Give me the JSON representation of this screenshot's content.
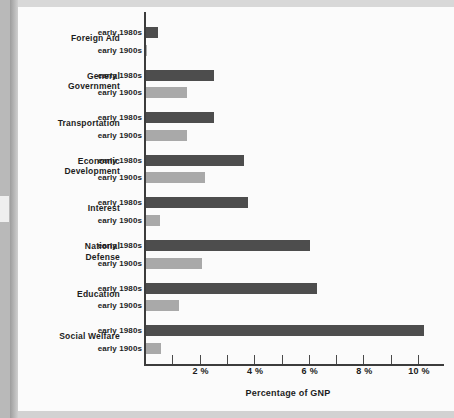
{
  "chart_data": {
    "type": "bar",
    "orientation": "horizontal",
    "title": "",
    "xlabel": "Percentage of GNP",
    "ylabel": "",
    "xlim": [
      0,
      11
    ],
    "xticks": [
      1,
      2,
      3,
      4,
      5,
      6,
      7,
      8,
      9,
      10
    ],
    "xticklabels": [
      "",
      "2 %",
      "",
      "4 %",
      "",
      "6 %",
      "",
      "8 %",
      "",
      "10 %"
    ],
    "grid": false,
    "legend_position": "inline-row-labels",
    "categories": [
      "Foreign Aid",
      "General Government",
      "Transportation",
      "Economic Development",
      "Interest",
      "National Defense",
      "Education",
      "Social Welfare"
    ],
    "series": [
      {
        "name": "early 1980s",
        "color": "#4d4d4d",
        "values": [
          0.45,
          2.5,
          2.5,
          3.6,
          3.75,
          6.0,
          6.25,
          10.2
        ]
      },
      {
        "name": "early 1900s",
        "color": "#a9a9a9",
        "values": [
          0.03,
          1.5,
          1.5,
          2.15,
          0.5,
          2.05,
          1.2,
          0.55
        ]
      }
    ]
  },
  "axis": {
    "title": "Percentage of GNP",
    "ticks": [
      {
        "value": 1,
        "label": ""
      },
      {
        "value": 2,
        "label": "2 %"
      },
      {
        "value": 3,
        "label": ""
      },
      {
        "value": 4,
        "label": "4 %"
      },
      {
        "value": 5,
        "label": ""
      },
      {
        "value": 6,
        "label": "6 %"
      },
      {
        "value": 7,
        "label": ""
      },
      {
        "value": 8,
        "label": "8 %"
      },
      {
        "value": 9,
        "label": ""
      },
      {
        "value": 10,
        "label": "10 %"
      }
    ]
  },
  "groups": [
    {
      "name": "Foreign Aid",
      "line1": "Foreign  Aid",
      "line2": "",
      "rows": [
        {
          "label": "early 1980s",
          "value": 0.45,
          "series": 0
        },
        {
          "label": "early 1900s",
          "value": 0.03,
          "series": 1
        }
      ]
    },
    {
      "name": "General Government",
      "line1": "General",
      "line2": "Government",
      "rows": [
        {
          "label": "early 1980s",
          "value": 2.5,
          "series": 0
        },
        {
          "label": "early 1900s",
          "value": 1.5,
          "series": 1
        }
      ]
    },
    {
      "name": "Transportation",
      "line1": "Transportation",
      "line2": "",
      "rows": [
        {
          "label": "early 1980s",
          "value": 2.5,
          "series": 0
        },
        {
          "label": "early 1900s",
          "value": 1.5,
          "series": 1
        }
      ]
    },
    {
      "name": "Economic Development",
      "line1": "Economic",
      "line2": "Development",
      "rows": [
        {
          "label": "early 1980s",
          "value": 3.6,
          "series": 0
        },
        {
          "label": "early 1900s",
          "value": 2.15,
          "series": 1
        }
      ]
    },
    {
      "name": "Interest",
      "line1": "Interest",
      "line2": "",
      "rows": [
        {
          "label": "early 1980s",
          "value": 3.75,
          "series": 0
        },
        {
          "label": "early 1900s",
          "value": 0.5,
          "series": 1
        }
      ]
    },
    {
      "name": "National Defense",
      "line1": "National",
      "line2": "Defense",
      "rows": [
        {
          "label": "early 1980s",
          "value": 6.0,
          "series": 0
        },
        {
          "label": "early 1900s",
          "value": 2.05,
          "series": 1
        }
      ]
    },
    {
      "name": "Education",
      "line1": "Education",
      "line2": "",
      "rows": [
        {
          "label": "early 1980s",
          "value": 6.25,
          "series": 0
        },
        {
          "label": "early 1900s",
          "value": 1.2,
          "series": 1
        }
      ]
    },
    {
      "name": "Social Welfare",
      "line1": "Social  Welfare",
      "line2": "",
      "rows": [
        {
          "label": "early 1980s",
          "value": 10.2,
          "series": 0
        },
        {
          "label": "early 1900s",
          "value": 0.55,
          "series": 1
        }
      ]
    }
  ],
  "colors": {
    "series_1980s": "#4d4d4d",
    "series_1900s": "#a9a9a9",
    "axis": "#3c3c3c",
    "text": "#1d1d1d",
    "page": "#fbfbfb",
    "gutter": "#b9b9b9"
  }
}
